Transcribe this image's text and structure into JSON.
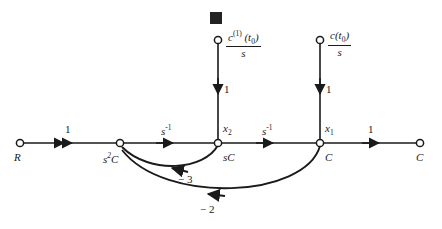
{
  "figure": {
    "type": "signal-flow-graph",
    "background_color": "#ffffff",
    "ink_color": "#1a1a1a",
    "marker": {
      "name": "black-square-marker",
      "shape": "filled-square",
      "color": "#232323",
      "x": 210,
      "y": 12,
      "size": 12
    }
  },
  "nodes": [
    {
      "id": "R",
      "label": "R",
      "label_pos": "below",
      "x": 20,
      "y": 143
    },
    {
      "id": "s2C",
      "label": "s",
      "label_sup": "2",
      "label_tail": "C",
      "label_pos": "below",
      "x": 120,
      "y": 143
    },
    {
      "id": "x2",
      "label": "sC",
      "label_pos": "below",
      "top_label": "x",
      "top_sub": "2",
      "x": 218,
      "y": 143
    },
    {
      "id": "x1",
      "label": "C",
      "label_pos": "below",
      "top_label": "x",
      "top_sub": "1",
      "x": 320,
      "y": 143
    },
    {
      "id": "Cout",
      "label": "C",
      "label_pos": "below",
      "x": 420,
      "y": 143
    },
    {
      "id": "src1",
      "label": "",
      "x": 218,
      "y": 40
    },
    {
      "id": "src2",
      "label": "",
      "x": 320,
      "y": 40
    }
  ],
  "node_labels": {
    "R": "R",
    "s2C_base": "s",
    "s2C_exp": "2",
    "s2C_tail": "C",
    "sC": "sC",
    "C_mid": "C",
    "C_out": "C",
    "x2_base": "x",
    "x2_sub": "2",
    "x1_base": "x",
    "x1_sub": "1"
  },
  "sources": [
    {
      "name": "source-c1-t0-over-s",
      "numerator_base": "c",
      "numerator_sup": "(1)",
      "numerator_arg_base": "(t",
      "numerator_arg_sub": "0",
      "numerator_arg_close": ")",
      "denominator": "s",
      "x": 218,
      "y": 40
    },
    {
      "name": "source-c-t0-over-s",
      "numerator_base": "c",
      "numerator_sup": "",
      "numerator_arg_base": "(t",
      "numerator_arg_sub": "0",
      "numerator_arg_close": ")",
      "denominator": "s",
      "x": 320,
      "y": 40
    }
  ],
  "edges": [
    {
      "name": "edge-R-to-s2C",
      "from": "R",
      "to": "s2C",
      "weight": "1",
      "weight_style": "upright",
      "label_x": 68,
      "label_y": 127
    },
    {
      "name": "edge-s2C-to-x2",
      "from": "s2C",
      "to": "x2",
      "weight": "s",
      "weight_sup": "-1",
      "weight_style": "italic-sup",
      "label_x": 166,
      "label_y": 127
    },
    {
      "name": "edge-x2-to-x1",
      "from": "x2",
      "to": "x1",
      "weight": "s",
      "weight_sup": "-1",
      "weight_style": "italic-sup",
      "label_x": 266,
      "label_y": 127
    },
    {
      "name": "edge-x1-to-Cout",
      "from": "x1",
      "to": "Cout",
      "weight": "1",
      "weight_style": "upright",
      "label_x": 371,
      "label_y": 127
    },
    {
      "name": "edge-src1-to-x2",
      "from": "src1",
      "to": "x2",
      "weight": "1",
      "weight_style": "upright",
      "label_x": 224,
      "label_y": 90
    },
    {
      "name": "edge-src2-to-x1",
      "from": "src2",
      "to": "x1",
      "weight": "1",
      "weight_style": "upright",
      "label_x": 326,
      "label_y": 90
    },
    {
      "name": "edge-feedback-x2-to-s2C",
      "from": "x2",
      "to": "s2C",
      "weight": "− 3",
      "weight_style": "upright",
      "label_x": 186,
      "label_y": 177,
      "curved": true
    },
    {
      "name": "edge-feedback-x1-to-s2C",
      "from": "x1",
      "to": "s2C",
      "weight": "− 2",
      "weight_style": "upright",
      "label_x": 208,
      "label_y": 207,
      "curved": true
    }
  ],
  "edge_weights": {
    "w_R_s2C": "1",
    "w_s2C_x2_base": "s",
    "w_s2C_x2_sup": "-1",
    "w_x2_x1_base": "s",
    "w_x2_x1_sup": "-1",
    "w_x1_Cout": "1",
    "w_src1_x2": "1",
    "w_src2_x1": "1",
    "w_fb_inner": "− 3",
    "w_fb_outer": "− 2"
  }
}
